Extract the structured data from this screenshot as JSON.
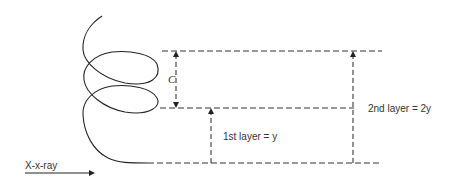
{
  "diagram": {
    "type": "helix-layer-diagram",
    "labels": {
      "pitch": "C",
      "first_layer": "1st layer = y",
      "second_layer": "2nd layer = 2y",
      "xray": "X-x-ray"
    },
    "colors": {
      "line": "#222222",
      "dashed": "#333333",
      "text": "#333333",
      "background": "#ffffff"
    }
  }
}
